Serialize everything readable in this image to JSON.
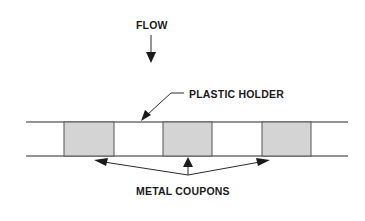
{
  "diagram": {
    "flow_label": "FLOW",
    "holder_label": "PLASTIC HOLDER",
    "coupons_label": "METAL COUPONS",
    "coupon_count": 3,
    "colors": {
      "line": "#2a2a2a",
      "coupon_fill": "#d4d4d4",
      "coupon_border": "#555555",
      "text": "#1a1a1a"
    }
  }
}
